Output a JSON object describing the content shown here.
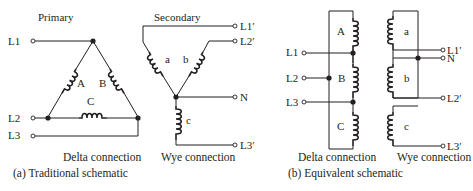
{
  "figure": {
    "panel_a": {
      "caption": "(a) Traditional schematic",
      "primary": {
        "title": "Primary",
        "subtitle": "Delta connection",
        "terminals": [
          "L1",
          "L2",
          "L3"
        ],
        "coils": [
          "A",
          "B",
          "C"
        ]
      },
      "secondary": {
        "title": "Secondary",
        "subtitle": "Wye connection",
        "terminals": [
          "L1′",
          "L2′",
          "N",
          "L3′"
        ],
        "coils": [
          "a",
          "b",
          "c"
        ]
      }
    },
    "panel_b": {
      "caption": "(b) Equivalent schematic",
      "primary": {
        "subtitle": "Delta connection",
        "terminals": [
          "L1",
          "L2",
          "L3"
        ],
        "coils": [
          "A",
          "B",
          "C"
        ]
      },
      "secondary": {
        "subtitle": "Wye connection",
        "terminals": [
          "L1′",
          "N",
          "L2′",
          "L3′"
        ],
        "coils": [
          "a",
          "b",
          "c"
        ]
      }
    }
  }
}
